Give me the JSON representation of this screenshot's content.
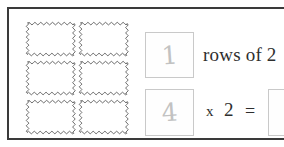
{
  "worksheet": {
    "title": "rows-of-2-multiplication-task",
    "frame_color": "#3a3a3a",
    "background_color": "#ffffff"
  },
  "stamp_array": {
    "icon": "postage-stamp-icon",
    "rows": 3,
    "columns": 2,
    "total": 6,
    "outline_color": "#4a4a4a",
    "fill_color": "#ffffff"
  },
  "sentence": {
    "rows_answer_value": "1",
    "rows_of_label": "rows of 2"
  },
  "equation": {
    "factor_answer_value": "4",
    "times_symbol": "x",
    "second_factor": "2",
    "equals_symbol": "=",
    "result_answer_value": ""
  },
  "handwriting": {
    "color": "#c2c2c2"
  }
}
